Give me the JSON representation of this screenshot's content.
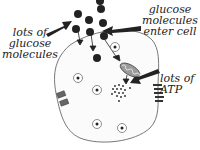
{
  "diagram": {
    "labels": {
      "lots_of_glucose": [
        "lots of",
        "glucose",
        "molecules"
      ],
      "glucose_enter": [
        "glucose",
        "molecules",
        "enter cell"
      ],
      "lots_of_atp": [
        "lots of",
        "ATP"
      ]
    },
    "elements": {
      "cell_membrane": "cell-membrane",
      "glucose_molecules": "glucose-molecule",
      "mitochondrion": "mitochondrion",
      "atp_dots": "atp-molecule",
      "membrane_channels": "membrane-channel",
      "organelles": "organelle"
    },
    "colors": {
      "ink": "#222222",
      "membrane": "#555555",
      "mitochondrion_fill": "#9a9a9a",
      "channel_fill": "#666666",
      "background": "#ffffff"
    }
  }
}
